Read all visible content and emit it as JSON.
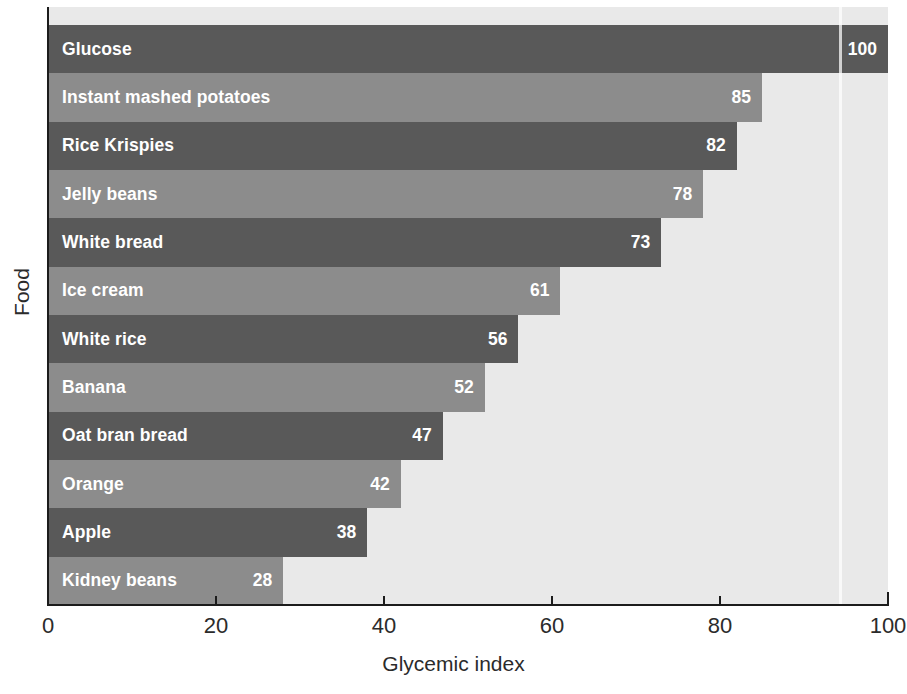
{
  "chart_data": {
    "type": "bar",
    "orientation": "horizontal",
    "title": "",
    "xlabel": "Glycemic index",
    "ylabel": "Food",
    "xlim": [
      0,
      100
    ],
    "xticks": [
      0,
      20,
      40,
      60,
      80,
      100
    ],
    "xticklabels": [
      "0",
      "20",
      "40",
      "60",
      "80",
      "100"
    ],
    "grid": false,
    "legend": null,
    "categories": [
      "Glucose",
      "Instant mashed potatoes",
      "Rice Krispies",
      "Jelly beans",
      "White bread",
      "Ice cream",
      "White rice",
      "Banana",
      "Oat bran bread",
      "Orange",
      "Apple",
      "Kidney beans"
    ],
    "values": [
      100,
      85,
      82,
      78,
      73,
      61,
      56,
      52,
      47,
      42,
      38,
      28
    ],
    "value_labels": [
      "100",
      "85",
      "82",
      "78",
      "73",
      "61",
      "56",
      "52",
      "47",
      "42",
      "38",
      "28"
    ],
    "bar_shades": [
      "dark",
      "medium",
      "dark",
      "medium",
      "dark",
      "medium",
      "dark",
      "medium",
      "dark",
      "medium",
      "dark",
      "medium"
    ]
  },
  "colors": {
    "bar_dark": "#595959",
    "bar_medium": "#8c8c8c",
    "plot_background": "#e9e9e9",
    "page_background": "#ffffff",
    "axis": "#1c1c1c",
    "bar_text": "#ffffff",
    "axis_text": "#2b2b2b"
  }
}
